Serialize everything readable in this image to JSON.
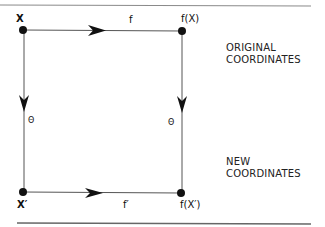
{
  "diagram": {
    "nodes": {
      "top_left": {
        "label": "X"
      },
      "top_right": {
        "label": "f(X)"
      },
      "bottom_left": {
        "label": "X′"
      },
      "bottom_right": {
        "label": "f(X′)"
      }
    },
    "edges": {
      "top": {
        "label": "f",
        "from": "X",
        "to": "f(X)"
      },
      "bottom": {
        "label": "f′",
        "from": "X′",
        "to": "f(X′)"
      },
      "left": {
        "label": "Θ",
        "from": "X",
        "to": "X′"
      },
      "right": {
        "label": "Θ",
        "from": "f(X)",
        "to": "f(X′)"
      }
    },
    "side_labels": {
      "original": {
        "line1": "ORIGINAL",
        "line2": "COORDINATES"
      },
      "new": {
        "line1": "NEW",
        "line2": "COORDINATES"
      }
    },
    "colors": {
      "line": "#555555",
      "ink": "#111111",
      "rule": "#777777"
    }
  }
}
